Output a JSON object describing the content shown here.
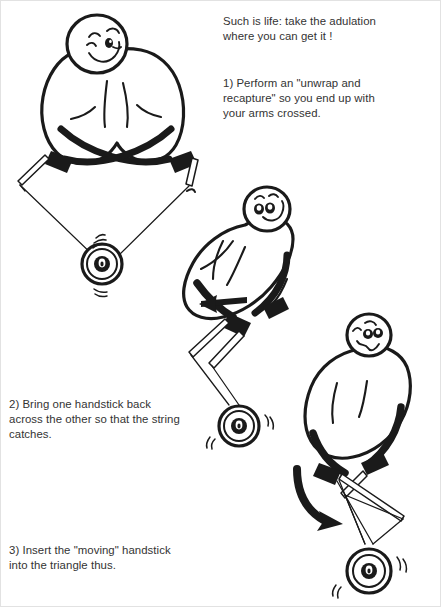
{
  "page": {
    "background_color": "#ffffff",
    "ink_color": "#1a1a1a",
    "text_color": "#333333",
    "border_color": "#e2e2e2",
    "width": 441,
    "height": 607
  },
  "captions": {
    "intro": "Such is life:  take the adulation\nwhere you can get it !",
    "step1": "1)  Perform an \"unwrap and\nrecapture\" so you end up with\nyour arms crossed.",
    "step2": "2)  Bring one handstick back\nacross the other so that the string\ncatches.",
    "step3": "3)  Insert the \"moving\" handstick\ninto the triangle thus."
  },
  "figures": [
    {
      "id": "figure-1",
      "label": "juggler with arms crossed holding handsticks",
      "face": "winking smile",
      "parts": [
        "head",
        "body",
        "crossed-arms",
        "left-handstick",
        "right-handstick",
        "string",
        "diabolo"
      ]
    },
    {
      "id": "figure-2",
      "label": "juggler bringing one handstick back across the other",
      "face": "wide eyes smile",
      "parts": [
        "head",
        "body",
        "arms",
        "handsticks",
        "motion-arrow-left",
        "string",
        "diabolo"
      ]
    },
    {
      "id": "figure-3",
      "label": "juggler inserting the moving handstick into the string triangle",
      "face": "crossed eyes wavy mouth",
      "parts": [
        "head",
        "body",
        "arms",
        "handsticks",
        "string-triangle",
        "motion-arrow-curved",
        "diabolo"
      ]
    }
  ],
  "annotations": {
    "arrow_straight": "motion-arrow-left",
    "arrow_curved": "motion-arrow-curved-down",
    "spin_marks": "diabolo spin speed lines"
  }
}
